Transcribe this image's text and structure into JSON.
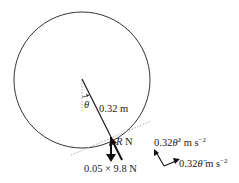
{
  "diagram": {
    "type": "physics free-body diagram",
    "circle": {
      "center": [
        82,
        80
      ],
      "radius": 68
    },
    "radius_line": {
      "from": [
        82,
        79
      ],
      "to": [
        111,
        137
      ]
    },
    "labels": {
      "angle": "θ",
      "radius": "0.32 m",
      "reaction_R": "R",
      "reaction_unit": " N",
      "weight": "0.05 × 9.8 N",
      "radial_accel_prefix": "0.32",
      "radial_accel_var": "θ̇",
      "radial_accel_exp": "2",
      "radial_accel_unit": " m s",
      "radial_accel_unit_exp": "−2",
      "tangential_accel_prefix": "0.32",
      "tangential_accel_var": "θ̈",
      "tangential_accel_unit": " m s",
      "tangential_accel_unit_exp": "−2"
    },
    "colors": {
      "line": "#222222",
      "dotted": "#999999"
    }
  }
}
